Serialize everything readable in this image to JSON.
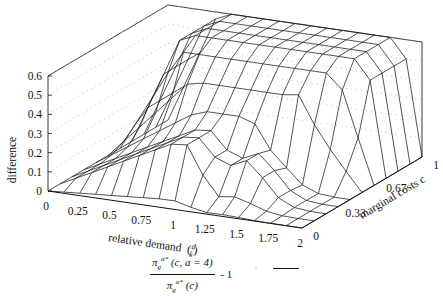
{
  "chart_data": {
    "type": "surface3d",
    "title": "",
    "xlabel": "relative demand (d/k)",
    "ylabel": "marginal costs c",
    "zlabel": "difference",
    "x_ticks": [
      "0",
      "0.25",
      "0.5",
      "0.75",
      "1",
      "1.25",
      "1.5",
      "1.75",
      "2"
    ],
    "y_ticks": [
      "0",
      "0.33",
      "0.67",
      "1"
    ],
    "z_ticks": [
      "0",
      "0.1",
      "0.2",
      "0.3",
      "0.4",
      "0.5",
      "0.6"
    ],
    "xlim": [
      0,
      2
    ],
    "ylim": [
      0,
      1
    ],
    "zlim": [
      0,
      0.6
    ],
    "grid": "dotted back walls",
    "legend": {
      "position": "bottom",
      "entries": [
        {
          "label": "π_g^{α*}(c, a=4) / π_g^{α*}(c) - 1",
          "style": "solid line"
        }
      ]
    },
    "x_grid": [
      0,
      0.125,
      0.25,
      0.375,
      0.5,
      0.625,
      0.75,
      0.875,
      1,
      1.125,
      1.25,
      1.375,
      1.5,
      1.625,
      1.75,
      1.875,
      2
    ],
    "y_grid": [
      0,
      0.1,
      0.2,
      0.3,
      0.4,
      0.5,
      0.6,
      0.7,
      0.8,
      0.9,
      1
    ]
  },
  "legend": {
    "numerator": "π",
    "numerator_sub": "g",
    "numerator_sup": "α*",
    "numerator_args": "(c, a = 4)",
    "denominator": "π",
    "denominator_sub": "g",
    "denominator_sup": "α*",
    "denominator_args": "(c)",
    "suffix": "- 1"
  },
  "labels": {
    "zlabel": "difference",
    "xlabel": "relative demand",
    "ylabel": "marginal costs c"
  }
}
